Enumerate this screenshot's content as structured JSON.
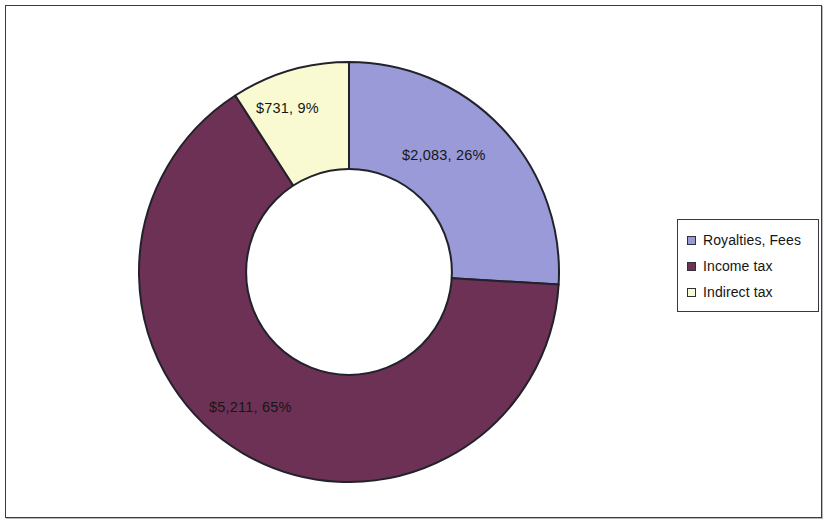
{
  "chart_data": {
    "type": "pie",
    "variant": "donut",
    "title": "",
    "categories": [
      "Royalties, Fees",
      "Income tax",
      "Indirect tax"
    ],
    "values": [
      2083,
      5211,
      731
    ],
    "percentages": [
      26,
      65,
      9
    ],
    "value_labels": [
      "$2,083",
      "$5,211",
      "$731"
    ],
    "data_labels": [
      "$2,083, 26%",
      "$5,211, 65%",
      "$731, 9%"
    ],
    "colors": [
      "#9a9ad8",
      "#6e3156",
      "#fafad2"
    ],
    "start_angle_deg": 0,
    "direction": "clockwise",
    "inner_radius_ratio": 0.49,
    "legend": {
      "position": "right",
      "entries": [
        {
          "label": "Royalties, Fees",
          "color": "#9a9ad8"
        },
        {
          "label": "Income tax",
          "color": "#6e3156"
        },
        {
          "label": "Indirect tax",
          "color": "#fafad2"
        }
      ]
    },
    "grid": false,
    "xlabel": "",
    "ylabel": ""
  },
  "labels": {
    "royalties": "$2,083, 26%",
    "income": "$5,211, 65%",
    "indirect": "$731, 9%"
  },
  "legend": {
    "items": [
      {
        "label": "Royalties, Fees"
      },
      {
        "label": "Income tax"
      },
      {
        "label": "Indirect tax"
      }
    ]
  },
  "style": {
    "slice_royalties_color": "#9a9ad8",
    "slice_income_color": "#6e3156",
    "slice_indirect_color": "#fafad2",
    "outline_color": "#22222a",
    "frame_border_color": "#3a3a42",
    "background_color": "#ffffff"
  }
}
